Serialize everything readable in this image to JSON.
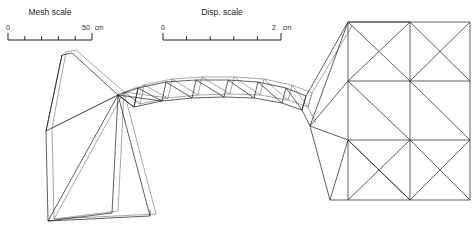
{
  "figure": {
    "kind": "finite-element-mesh-plot",
    "background_color": "#ffffff",
    "line_color_original": "#2b2b2b",
    "line_color_deformed": "#8a8a8a"
  },
  "scales": [
    {
      "id": "mesh-scale",
      "title": "Mesh scale",
      "min_label": "0",
      "max_label": "50",
      "unit": "cm",
      "ticks": 5,
      "bar": {
        "x": 8,
        "y": 40,
        "width": 84,
        "height": 7
      },
      "title_pos": {
        "x": 50,
        "y": 15
      },
      "min_pos": {
        "x": 8,
        "y": 30
      },
      "max_pos": {
        "x": 86,
        "y": 30
      },
      "unit_pos": {
        "x": 99,
        "y": 30
      }
    },
    {
      "id": "disp-scale",
      "title": "Disp. scale",
      "min_label": "0",
      "max_label": "2",
      "unit": "cm",
      "ticks": 5,
      "bar": {
        "x": 163,
        "y": 40,
        "width": 118,
        "height": 7
      },
      "title_pos": {
        "x": 222,
        "y": 15
      },
      "min_pos": {
        "x": 163,
        "y": 30
      },
      "max_pos": {
        "x": 274,
        "y": 30
      },
      "unit_pos": {
        "x": 287,
        "y": 30
      }
    }
  ],
  "chart_data": {
    "type": "mesh",
    "title": "",
    "xlabel": "",
    "ylabel": "",
    "legend": [
      "Mesh scale",
      "Disp. scale"
    ],
    "units": "cm",
    "mesh_scale_span_cm": 50,
    "disp_scale_span_cm": 2,
    "original_polylines": [
      [
        [
          46,
          131
        ],
        [
          62,
          55
        ],
        [
          72,
          53
        ],
        [
          118,
          95
        ]
      ],
      [
        [
          46,
          131
        ],
        [
          48,
          221
        ],
        [
          150,
          216
        ],
        [
          150,
          210
        ]
      ],
      [
        [
          46,
          131
        ],
        [
          118,
          95
        ]
      ],
      [
        [
          62,
          55
        ],
        [
          46,
          131
        ]
      ],
      [
        [
          118,
          95
        ],
        [
          150,
          216
        ]
      ],
      [
        [
          118,
          95
        ],
        [
          112,
          213
        ]
      ],
      [
        [
          112,
          213
        ],
        [
          48,
          221
        ]
      ],
      [
        [
          118,
          95
        ],
        [
          48,
          221
        ]
      ],
      [
        [
          118,
          95
        ],
        [
          138,
          88
        ],
        [
          166,
          82
        ],
        [
          196,
          80
        ],
        [
          228,
          80
        ],
        [
          258,
          82
        ],
        [
          286,
          88
        ],
        [
          306,
          96
        ]
      ],
      [
        [
          118,
          95
        ],
        [
          134,
          107
        ],
        [
          162,
          101
        ],
        [
          192,
          98
        ],
        [
          224,
          97
        ],
        [
          254,
          98
        ],
        [
          282,
          103
        ],
        [
          302,
          110
        ]
      ],
      [
        [
          118,
          95
        ],
        [
          134,
          107
        ]
      ],
      [
        [
          138,
          88
        ],
        [
          134,
          107
        ]
      ],
      [
        [
          166,
          82
        ],
        [
          162,
          101
        ]
      ],
      [
        [
          196,
          80
        ],
        [
          192,
          98
        ]
      ],
      [
        [
          228,
          80
        ],
        [
          224,
          97
        ]
      ],
      [
        [
          258,
          82
        ],
        [
          254,
          98
        ]
      ],
      [
        [
          286,
          88
        ],
        [
          282,
          103
        ]
      ],
      [
        [
          306,
          96
        ],
        [
          302,
          110
        ]
      ],
      [
        [
          118,
          95
        ],
        [
          162,
          101
        ]
      ],
      [
        [
          138,
          88
        ],
        [
          162,
          101
        ]
      ],
      [
        [
          166,
          82
        ],
        [
          192,
          98
        ]
      ],
      [
        [
          196,
          80
        ],
        [
          224,
          97
        ]
      ],
      [
        [
          228,
          80
        ],
        [
          254,
          98
        ]
      ],
      [
        [
          258,
          82
        ],
        [
          282,
          103
        ]
      ],
      [
        [
          286,
          88
        ],
        [
          302,
          110
        ]
      ],
      [
        [
          134,
          107
        ],
        [
          138,
          88
        ]
      ],
      [
        [
          302,
          110
        ],
        [
          306,
          96
        ]
      ],
      [
        [
          306,
          96
        ],
        [
          348,
          22
        ]
      ],
      [
        [
          302,
          110
        ],
        [
          310,
          126
        ]
      ],
      [
        [
          310,
          126
        ],
        [
          348,
          22
        ]
      ],
      [
        [
          348,
          22
        ],
        [
          470,
          22
        ]
      ],
      [
        [
          348,
          22
        ],
        [
          348,
          140
        ]
      ],
      [
        [
          310,
          126
        ],
        [
          348,
          140
        ]
      ],
      [
        [
          348,
          140
        ],
        [
          470,
          140
        ]
      ],
      [
        [
          470,
          22
        ],
        [
          470,
          140
        ]
      ],
      [
        [
          348,
          22
        ],
        [
          410,
          22
        ]
      ],
      [
        [
          410,
          22
        ],
        [
          410,
          140
        ]
      ],
      [
        [
          348,
          81
        ],
        [
          470,
          81
        ]
      ],
      [
        [
          310,
          126
        ],
        [
          348,
          81
        ]
      ],
      [
        [
          348,
          22
        ],
        [
          410,
          81
        ]
      ],
      [
        [
          410,
          22
        ],
        [
          470,
          81
        ]
      ],
      [
        [
          348,
          81
        ],
        [
          410,
          140
        ]
      ],
      [
        [
          410,
          81
        ],
        [
          470,
          140
        ]
      ],
      [
        [
          348,
          81
        ],
        [
          410,
          22
        ]
      ],
      [
        [
          410,
          81
        ],
        [
          470,
          22
        ]
      ],
      [
        [
          348,
          140
        ],
        [
          410,
          200
        ]
      ],
      [
        [
          410,
          140
        ],
        [
          470,
          200
        ]
      ],
      [
        [
          348,
          140
        ],
        [
          410,
          200
        ]
      ],
      [
        [
          348,
          140
        ],
        [
          348,
          200
        ]
      ],
      [
        [
          410,
          140
        ],
        [
          410,
          200
        ]
      ],
      [
        [
          470,
          140
        ],
        [
          470,
          200
        ]
      ],
      [
        [
          348,
          200
        ],
        [
          470,
          200
        ]
      ],
      [
        [
          348,
          200
        ],
        [
          410,
          140
        ]
      ],
      [
        [
          410,
          200
        ],
        [
          470,
          140
        ]
      ],
      [
        [
          348,
          140
        ],
        [
          330,
          200
        ]
      ],
      [
        [
          330,
          200
        ],
        [
          348,
          200
        ]
      ],
      [
        [
          310,
          126
        ],
        [
          330,
          200
        ]
      ]
    ],
    "deformed_polylines": [
      [
        [
          52,
          128
        ],
        [
          66,
          52
        ],
        [
          76,
          50
        ],
        [
          124,
          92
        ]
      ],
      [
        [
          52,
          128
        ],
        [
          54,
          219
        ],
        [
          156,
          214
        ]
      ],
      [
        [
          52,
          128
        ],
        [
          124,
          92
        ]
      ],
      [
        [
          124,
          92
        ],
        [
          156,
          214
        ]
      ],
      [
        [
          124,
          92
        ],
        [
          118,
          211
        ]
      ],
      [
        [
          118,
          211
        ],
        [
          54,
          219
        ]
      ],
      [
        [
          124,
          92
        ],
        [
          54,
          219
        ]
      ],
      [
        [
          124,
          92
        ],
        [
          144,
          85
        ],
        [
          172,
          79
        ],
        [
          202,
          77
        ],
        [
          234,
          77
        ],
        [
          264,
          79
        ],
        [
          292,
          85
        ],
        [
          312,
          93
        ]
      ],
      [
        [
          124,
          92
        ],
        [
          140,
          104
        ],
        [
          168,
          98
        ],
        [
          198,
          95
        ],
        [
          230,
          94
        ],
        [
          260,
          95
        ],
        [
          288,
          100
        ],
        [
          308,
          107
        ]
      ],
      [
        [
          124,
          92
        ],
        [
          140,
          104
        ]
      ],
      [
        [
          144,
          85
        ],
        [
          140,
          104
        ]
      ],
      [
        [
          172,
          79
        ],
        [
          168,
          98
        ]
      ],
      [
        [
          202,
          77
        ],
        [
          198,
          95
        ]
      ],
      [
        [
          234,
          77
        ],
        [
          230,
          94
        ]
      ],
      [
        [
          264,
          79
        ],
        [
          260,
          95
        ]
      ],
      [
        [
          292,
          85
        ],
        [
          288,
          100
        ]
      ],
      [
        [
          312,
          93
        ],
        [
          308,
          107
        ]
      ],
      [
        [
          124,
          92
        ],
        [
          168,
          98
        ]
      ],
      [
        [
          144,
          85
        ],
        [
          168,
          98
        ]
      ],
      [
        [
          172,
          79
        ],
        [
          198,
          95
        ]
      ],
      [
        [
          202,
          77
        ],
        [
          230,
          94
        ]
      ],
      [
        [
          234,
          77
        ],
        [
          260,
          95
        ]
      ],
      [
        [
          264,
          79
        ],
        [
          288,
          100
        ]
      ],
      [
        [
          292,
          85
        ],
        [
          308,
          107
        ]
      ],
      [
        [
          308,
          107
        ],
        [
          312,
          93
        ]
      ],
      [
        [
          312,
          93
        ],
        [
          352,
          26
        ]
      ],
      [
        [
          308,
          107
        ],
        [
          316,
          123
        ]
      ]
    ]
  }
}
